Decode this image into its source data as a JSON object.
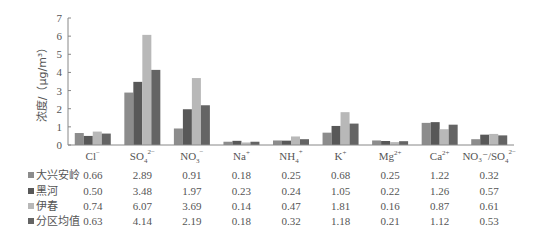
{
  "chart_data": {
    "type": "bar",
    "title": "",
    "xlabel": "",
    "ylabel": "浓度/（μg/m³）",
    "ylim": [
      0,
      7
    ],
    "yticks": [
      0,
      1,
      2,
      3,
      4,
      5,
      6,
      7
    ],
    "grid": false,
    "legend_position": "bottom-left (data table rows)",
    "categories": [
      {
        "base": "Cl",
        "sub": "",
        "sup": "−"
      },
      {
        "base": "SO",
        "sub": "4",
        "sup": "2−"
      },
      {
        "base": "NO",
        "sub": "3",
        "sup": "−"
      },
      {
        "base": "Na",
        "sub": "",
        "sup": "+"
      },
      {
        "base": "NH",
        "sub": "4",
        "sup": "+"
      },
      {
        "base": "K",
        "sub": "",
        "sup": "+"
      },
      {
        "base": "Mg",
        "sub": "",
        "sup": "2+"
      },
      {
        "base": "Ca",
        "sub": "",
        "sup": "2+"
      },
      {
        "base": "NO₃⁻/SO",
        "sub": "4",
        "sup": "2−"
      }
    ],
    "category_names": [
      "Cl⁻",
      "SO₄²⁻",
      "NO₃⁻",
      "Na⁺",
      "NH₄⁺",
      "K⁺",
      "Mg²⁺",
      "Ca²⁺",
      "NO₃⁻/SO₄²⁻"
    ],
    "series": [
      {
        "name": "大兴安岭",
        "color": "#8c8c8c",
        "values": [
          0.66,
          2.89,
          0.91,
          0.18,
          0.25,
          0.68,
          0.25,
          1.22,
          0.32
        ]
      },
      {
        "name": "黑河",
        "color": "#585858",
        "values": [
          0.5,
          3.48,
          1.97,
          0.23,
          0.24,
          1.05,
          0.22,
          1.26,
          0.57
        ]
      },
      {
        "name": "伊春",
        "color": "#b8b8b8",
        "values": [
          0.74,
          6.07,
          3.69,
          0.14,
          0.47,
          1.81,
          0.16,
          0.87,
          0.61
        ]
      },
      {
        "name": "分区均值",
        "color": "#646464",
        "values": [
          0.63,
          4.14,
          2.19,
          0.18,
          0.32,
          1.18,
          0.21,
          1.12,
          0.53
        ]
      }
    ]
  }
}
